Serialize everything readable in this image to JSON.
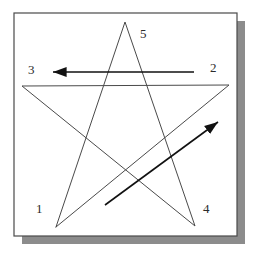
{
  "figure": {
    "frame": {
      "border_color": "#4a4a4a",
      "fill_color": "#ffffff",
      "shadow_color": "#8c8c8c",
      "x": 14,
      "y": 13,
      "width": 223,
      "height": 223,
      "shadow_offset": 8
    },
    "star": {
      "stroke_color": "#4a4a4a",
      "stroke_width": 1,
      "vertices": [
        {
          "label": "1",
          "x": 56,
          "y": 227,
          "label_x": 36,
          "label_y": 202
        },
        {
          "label": "2",
          "x": 229,
          "y": 85,
          "label_x": 210,
          "label_y": 61
        },
        {
          "label": "3",
          "x": 22,
          "y": 86,
          "label_x": 28,
          "label_y": 63
        },
        {
          "label": "4",
          "x": 195,
          "y": 226,
          "label_x": 203,
          "label_y": 202
        },
        {
          "label": "5",
          "x": 125,
          "y": 22,
          "label_x": 140,
          "label_y": 27
        }
      ],
      "path_order": [
        "1",
        "2",
        "3",
        "4",
        "5",
        "1"
      ],
      "path_points": "56,227 229,85 22,86 195,226 125,22 56,227"
    },
    "arrows": {
      "stroke_color": "#111111",
      "stroke_width": 1.6,
      "items": [
        {
          "name": "horizontal-direction-arrow",
          "direction": "leftward",
          "from_x": 194,
          "from_y": 72,
          "to_x": 53,
          "to_y": 72
        },
        {
          "name": "diagonal-direction-arrow",
          "direction": "up-right",
          "from_x": 105,
          "from_y": 205,
          "to_x": 218,
          "to_y": 122
        }
      ]
    }
  }
}
